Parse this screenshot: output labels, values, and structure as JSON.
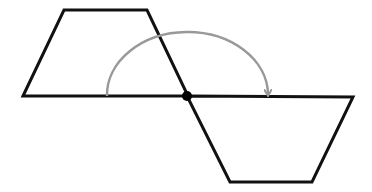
{
  "diagram": {
    "colors": {
      "background": "#ffffff",
      "shape_stroke": "#111111",
      "arc_stroke": "#999999",
      "center_point": "#000000"
    },
    "original_trapezoid": {
      "points": [
        [
          23,
          96
        ],
        [
          64,
          10
        ],
        [
          147,
          10
        ],
        [
          188,
          96
        ]
      ]
    },
    "rotated_trapezoid": {
      "points": [
        [
          187,
          96
        ],
        [
          353,
          97
        ],
        [
          312,
          182
        ],
        [
          230,
          182
        ]
      ]
    },
    "center_of_rotation": {
      "x": 187,
      "y": 96,
      "r": 5
    },
    "rotation_arc": {
      "start": [
        107,
        96
      ],
      "end": [
        268,
        94
      ],
      "direction": "clockwise",
      "angle_degrees": 180
    }
  }
}
